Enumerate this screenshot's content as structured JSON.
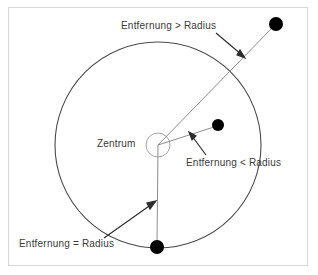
{
  "figure": {
    "background_color": "#ffffff",
    "frame_color": "#d8d8d8",
    "stroke_color": "#4a4a4a",
    "marker_color": "#000000",
    "text_color": "#3a3a3a",
    "labels": {
      "outside": "Entfernung > Radius",
      "center": "Zentrum",
      "inside": "Entfernung < Radius",
      "on_circle": "Entfernung = Radius"
    },
    "geometry": {
      "circle_center": [
        158,
        145
      ],
      "circle_radius": 103,
      "center_dot_radius": 12,
      "points": [
        {
          "name": "point-outside",
          "x": 276,
          "y": 24,
          "radius": 7,
          "relation": "Entfernung > Radius"
        },
        {
          "name": "point-inside",
          "x": 218,
          "y": 125,
          "radius": 6,
          "relation": "Entfernung < Radius"
        },
        {
          "name": "point-on-circle",
          "x": 157,
          "y": 247,
          "radius": 7,
          "relation": "Entfernung = Radius"
        }
      ],
      "leader_arrows": [
        {
          "name": "arrow-outside",
          "from": [
            216,
            33
          ],
          "to": [
            244,
            57
          ]
        },
        {
          "name": "arrow-inside",
          "from": [
            205,
            154
          ],
          "to": [
            190,
            133
          ]
        },
        {
          "name": "arrow-on-circle",
          "from": [
            105,
            237
          ],
          "to": [
            155,
            202
          ]
        }
      ]
    }
  }
}
